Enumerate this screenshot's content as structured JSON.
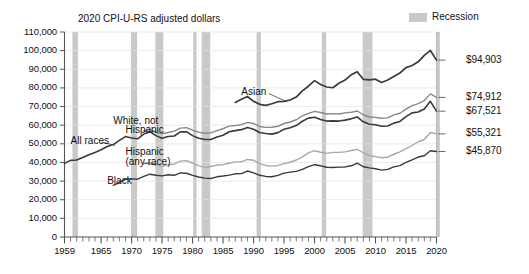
{
  "chart_data": {
    "type": "line",
    "title": "2020 CPI-U-RS adjusted dollars",
    "xlabel": "",
    "ylabel": "",
    "xlim": [
      1959,
      2020
    ],
    "ylim": [
      0,
      110000
    ],
    "grid": true,
    "legend_position": "top-right",
    "legend": [
      {
        "label": "Recession",
        "color": "#c9c9c9",
        "kind": "band"
      }
    ],
    "ytick_labels": [
      "0",
      "10,000",
      "20,000",
      "30,000",
      "40,000",
      "50,000",
      "60,000",
      "70,000",
      "80,000",
      "90,000",
      "100,000",
      "110,000"
    ],
    "ytick_values": [
      0,
      10000,
      20000,
      30000,
      40000,
      50000,
      60000,
      70000,
      80000,
      90000,
      100000,
      110000
    ],
    "xtick_labels": [
      "1959",
      "1965",
      "1970",
      "1975",
      "1980",
      "1985",
      "1990",
      "1995",
      "2000",
      "2005",
      "2010",
      "2015",
      "2020"
    ],
    "xtick_values": [
      1959,
      1965,
      1970,
      1975,
      1980,
      1985,
      1990,
      1995,
      2000,
      2005,
      2010,
      2015,
      2020
    ],
    "annotations": [
      {
        "text": "Asian",
        "x": 1988,
        "y": 78000
      },
      {
        "text": "White, not",
        "x": 1967,
        "y": 62500
      },
      {
        "text": "Hispanic",
        "x": 1969,
        "y": 57500
      },
      {
        "text": "All races",
        "x": 1960,
        "y": 51500
      },
      {
        "text": "Hispanic",
        "x": 1969,
        "y": 45500
      },
      {
        "text": "(any race)",
        "x": 1969,
        "y": 40500
      },
      {
        "text": "Black",
        "x": 1966,
        "y": 30000
      }
    ],
    "end_labels": [
      {
        "text": "$94,903",
        "series": "Asian",
        "value": 94903
      },
      {
        "text": "$74,912",
        "series": "White, not Hispanic",
        "value": 74912
      },
      {
        "text": "$67,521",
        "series": "All races",
        "value": 67521
      },
      {
        "text": "$55,321",
        "series": "Hispanic (any race)",
        "value": 55321
      },
      {
        "text": "$45,870",
        "series": "Black",
        "value": 45870
      }
    ],
    "recession_bands": [
      {
        "start": 1960.3,
        "end": 1961.2
      },
      {
        "start": 1969.9,
        "end": 1970.9
      },
      {
        "start": 1973.9,
        "end": 1975.2
      },
      {
        "start": 1980.1,
        "end": 1980.6
      },
      {
        "start": 1981.5,
        "end": 1982.9
      },
      {
        "start": 1990.5,
        "end": 1991.2
      },
      {
        "start": 2001.2,
        "end": 2001.9
      },
      {
        "start": 2007.9,
        "end": 2009.5
      },
      {
        "start": 2020.0,
        "end": 2020.4
      }
    ],
    "x": [
      1959,
      1960,
      1961,
      1962,
      1963,
      1964,
      1965,
      1966,
      1967,
      1968,
      1969,
      1970,
      1971,
      1972,
      1973,
      1974,
      1975,
      1976,
      1977,
      1978,
      1979,
      1980,
      1981,
      1982,
      1983,
      1984,
      1985,
      1986,
      1987,
      1988,
      1989,
      1990,
      1991,
      1992,
      1993,
      1994,
      1995,
      1996,
      1997,
      1998,
      1999,
      2000,
      2001,
      2002,
      2003,
      2004,
      2005,
      2006,
      2007,
      2008,
      2009,
      2010,
      2011,
      2012,
      2013,
      2014,
      2015,
      2016,
      2017,
      2018,
      2019,
      2020
    ],
    "series": [
      {
        "name": "Asian",
        "color": "#3a3a3a",
        "width": 1.7,
        "x_start": 1987,
        "values": [
          null,
          null,
          null,
          null,
          null,
          null,
          null,
          null,
          null,
          null,
          null,
          null,
          null,
          null,
          null,
          null,
          null,
          null,
          null,
          null,
          null,
          null,
          null,
          null,
          null,
          null,
          null,
          null,
          72200,
          73900,
          75400,
          72800,
          71200,
          70600,
          71500,
          72600,
          72800,
          73500,
          75100,
          78400,
          80900,
          83900,
          81800,
          80500,
          80100,
          82500,
          84200,
          87000,
          88700,
          84600,
          84300,
          84700,
          82900,
          84200,
          86100,
          88000,
          90900,
          92000,
          94000,
          97500,
          100100,
          94903
        ]
      },
      {
        "name": "White, not Hispanic",
        "color": "#888888",
        "width": 1.4,
        "x_start": 1972,
        "values": [
          null,
          null,
          null,
          null,
          null,
          null,
          null,
          null,
          null,
          null,
          null,
          null,
          null,
          57100,
          57800,
          56200,
          55300,
          56100,
          56800,
          58400,
          58700,
          57300,
          56300,
          55700,
          55900,
          57100,
          58100,
          59500,
          59800,
          60300,
          61500,
          60900,
          59300,
          58800,
          58900,
          59400,
          60900,
          61700,
          62900,
          65000,
          66300,
          67400,
          66800,
          66000,
          66200,
          66000,
          66600,
          66900,
          67600,
          65600,
          64400,
          64200,
          63700,
          63900,
          65500,
          66400,
          68600,
          70500,
          71600,
          73200,
          76800,
          74912
        ]
      },
      {
        "name": "All races",
        "color": "#3a3a3a",
        "width": 1.6,
        "x_start": 1959,
        "values": [
          39500,
          41100,
          41300,
          42700,
          44100,
          45400,
          46800,
          48600,
          49600,
          51800,
          53900,
          53100,
          52700,
          55200,
          56500,
          54400,
          53000,
          53900,
          54200,
          56400,
          56500,
          54400,
          53000,
          52300,
          52300,
          53700,
          54600,
          56500,
          57100,
          57600,
          58800,
          57800,
          56100,
          55500,
          55200,
          56000,
          57800,
          58600,
          59800,
          62100,
          63800,
          64300,
          63000,
          62200,
          62300,
          62200,
          62700,
          63400,
          64400,
          61800,
          60500,
          60200,
          59400,
          59600,
          61100,
          62000,
          64600,
          66600,
          67100,
          68700,
          72800,
          67521
        ]
      },
      {
        "name": "Hispanic (any race)",
        "color": "#a8a8a8",
        "width": 1.4,
        "x_start": 1972,
        "values": [
          null,
          null,
          null,
          null,
          null,
          null,
          null,
          null,
          null,
          null,
          null,
          null,
          null,
          39200,
          40200,
          38900,
          37900,
          38800,
          39200,
          40700,
          41000,
          39700,
          38300,
          37200,
          37800,
          38600,
          38800,
          39600,
          40300,
          40300,
          41600,
          41200,
          39400,
          38400,
          38000,
          38400,
          39400,
          40100,
          41300,
          43000,
          45100,
          46300,
          45500,
          44900,
          45400,
          45400,
          45700,
          46400,
          47000,
          45200,
          43700,
          43100,
          42500,
          42800,
          44400,
          45700,
          47400,
          49100,
          51100,
          52300,
          56100,
          55321
        ]
      },
      {
        "name": "Black",
        "color": "#3a3a3a",
        "width": 1.4,
        "x_start": 1967,
        "values": [
          null,
          null,
          null,
          null,
          null,
          null,
          null,
          null,
          27700,
          29200,
          31100,
          31200,
          31000,
          32500,
          33700,
          33100,
          32800,
          33400,
          33100,
          34400,
          34200,
          33100,
          32200,
          31600,
          31400,
          32300,
          32700,
          33200,
          33900,
          34000,
          35400,
          34400,
          33100,
          32500,
          32300,
          33100,
          34300,
          34800,
          35200,
          36300,
          37800,
          38800,
          38200,
          37400,
          37300,
          37500,
          37600,
          38200,
          39600,
          37700,
          37100,
          36600,
          35900,
          36300,
          37600,
          38300,
          40000,
          41400,
          42900,
          43600,
          46300,
          45870
        ]
      }
    ]
  },
  "axes": {
    "y_axis_name": "dollars-axis",
    "x_axis_name": "year-axis"
  }
}
